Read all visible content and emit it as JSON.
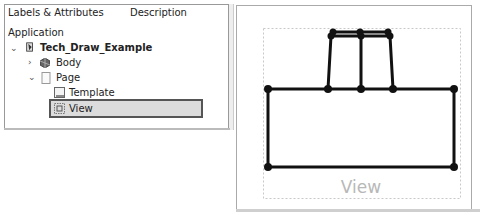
{
  "tree": {
    "columns": [
      "Labels & Attributes",
      "Description"
    ],
    "root_label": "Application",
    "items": [
      {
        "label": "Tech_Draw_Example",
        "level": 1,
        "expanded": true,
        "icon": "document-icon",
        "bold": true
      },
      {
        "label": "Body",
        "level": 2,
        "expanded": false,
        "icon": "body-icon"
      },
      {
        "label": "Page",
        "level": 2,
        "expanded": true,
        "icon": "page-icon"
      },
      {
        "label": "Template",
        "level": 3,
        "icon": "template-icon"
      },
      {
        "label": "View",
        "level": 3,
        "icon": "view-icon",
        "selected": true
      }
    ]
  },
  "drawing": {
    "view_label": "View",
    "line_color": "#111111",
    "frame_color": "#bfbfbf",
    "label_color": "#b8b8b8"
  }
}
